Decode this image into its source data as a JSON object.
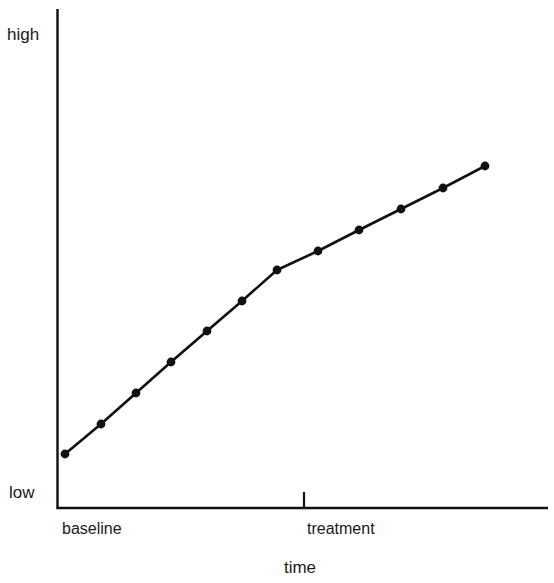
{
  "chart_data": {
    "type": "line",
    "title": "",
    "subtitle": "",
    "xlabel": "time",
    "ylabel": "",
    "ytick_labels": [
      "high",
      "low"
    ],
    "xtick_labels": [
      "baseline",
      "treatment"
    ],
    "grid": false,
    "legend": false,
    "axis_color": "#111111",
    "line_color": "#111111",
    "marker_color": "#111111",
    "marker_shape": "circle",
    "x": [
      1,
      2,
      3,
      4,
      5,
      6,
      7,
      8,
      9,
      10,
      11,
      12
    ],
    "values": [
      11.8,
      17.3,
      22.8,
      28.5,
      34.1,
      39.7,
      45.4,
      49.0,
      52.8,
      56.5,
      60.4,
      64.4
    ],
    "series": [
      {
        "name": "behavior level",
        "phase_labels": [
          "baseline",
          "baseline",
          "baseline",
          "baseline",
          "baseline",
          "baseline",
          "treatment",
          "treatment",
          "treatment",
          "treatment",
          "treatment",
          "treatment"
        ],
        "values": [
          11.8,
          17.3,
          22.8,
          28.5,
          34.1,
          39.7,
          45.4,
          49.0,
          52.8,
          56.5,
          60.4,
          64.4
        ]
      }
    ],
    "ylim": [
      0,
      100
    ],
    "xlim": [
      0,
      13.5
    ],
    "phase_change_x": 6.5,
    "pixel_points": [
      {
        "x": 65,
        "y": 454
      },
      {
        "x": 101,
        "y": 424
      },
      {
        "x": 136,
        "y": 393
      },
      {
        "x": 171,
        "y": 362
      },
      {
        "x": 207,
        "y": 331
      },
      {
        "x": 242,
        "y": 301
      },
      {
        "x": 277,
        "y": 270
      },
      {
        "x": 318,
        "y": 251
      },
      {
        "x": 359,
        "y": 230
      },
      {
        "x": 401,
        "y": 209
      },
      {
        "x": 443,
        "y": 188
      },
      {
        "x": 485,
        "y": 166
      }
    ]
  },
  "axes": {
    "y_high_label": "high",
    "y_low_label": "low",
    "x_phase_1_label": "baseline",
    "x_phase_2_label": "treatment",
    "x_axis_title": "time"
  }
}
